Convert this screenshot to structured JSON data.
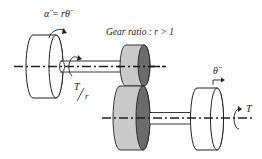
{
  "diagram": {
    "labels": {
      "input_accel": "α̈ = rθ̈",
      "gear_ratio": "Gear ratio : r > 1",
      "input_torque_num": "T",
      "input_torque_den": "r",
      "output_accel": "θ̈",
      "output_torque": "T"
    },
    "components": [
      {
        "id": "left-inertia-disc",
        "type": "disc"
      },
      {
        "id": "upper-shaft",
        "type": "shaft"
      },
      {
        "id": "small-gear",
        "type": "gear"
      },
      {
        "id": "large-gear",
        "type": "gear"
      },
      {
        "id": "lower-shaft",
        "type": "shaft"
      },
      {
        "id": "right-inertia-disc",
        "type": "disc"
      }
    ],
    "colors": {
      "gear_body": "#c8c8c8",
      "gear_face": "#6a6a6a",
      "line": "#222222"
    }
  }
}
